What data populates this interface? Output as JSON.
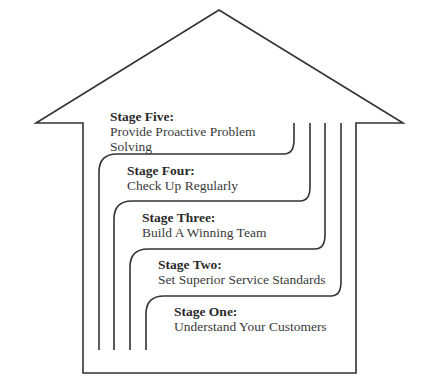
{
  "diagram": {
    "type": "house-stages",
    "stroke_color": "#333333",
    "stages": [
      {
        "title": "Stage Five:",
        "text_lines": [
          "Provide Proactive Problem",
          "Solving"
        ]
      },
      {
        "title": "Stage Four:",
        "text_lines": [
          "Check Up Regularly"
        ]
      },
      {
        "title": "Stage Three:",
        "text_lines": [
          "Build A Winning Team"
        ]
      },
      {
        "title": "Stage Two:",
        "text_lines": [
          "Set Superior Service Standards"
        ]
      },
      {
        "title": "Stage One:",
        "text_lines": [
          "Understand Your Customers"
        ]
      }
    ]
  }
}
